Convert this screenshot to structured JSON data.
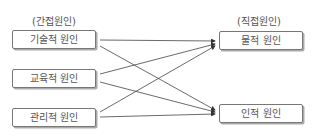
{
  "headers": {
    "left": "(간접원인)",
    "right": "(직접원인)"
  },
  "left_nodes": [
    {
      "label": "기술적 원인"
    },
    {
      "label": "교육적 원인"
    },
    {
      "label": "관리적 원인"
    }
  ],
  "right_nodes": [
    {
      "label": "물적 원인"
    },
    {
      "label": "인적 원인"
    }
  ],
  "edges": [
    {
      "from": "기술적 원인",
      "to": "물적 원인"
    },
    {
      "from": "기술적 원인",
      "to": "인적 원인"
    },
    {
      "from": "교육적 원인",
      "to": "물적 원인"
    },
    {
      "from": "교육적 원인",
      "to": "인적 원인"
    },
    {
      "from": "관리적 원인",
      "to": "물적 원인"
    },
    {
      "from": "관리적 원인",
      "to": "인적 원인"
    }
  ]
}
